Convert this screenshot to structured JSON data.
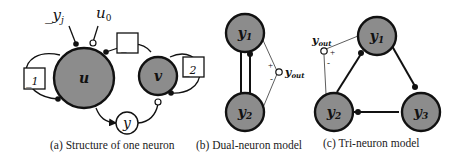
{
  "panel_a": {
    "caption": "(a) Structure of one neuron",
    "input_yj": "_y",
    "input_yj_sub": "j",
    "input_u0": "u",
    "input_u0_sub": "0",
    "node_u": "u",
    "node_v": "v",
    "node_y": "y",
    "box_top": "_",
    "box_left": "_1",
    "box_right": "_2"
  },
  "panel_b": {
    "caption": "(b) Dual-neuron model",
    "node_y1": "y",
    "node_y1_sub": "1",
    "node_y2": "y",
    "node_y2_sub": "2",
    "output": "y",
    "output_sub": "out",
    "plus": "+",
    "minus": "-"
  },
  "panel_c": {
    "caption": "(c) Tri-neuron model",
    "node_y1": "y",
    "node_y1_sub": "1",
    "node_y2": "y",
    "node_y2_sub": "2",
    "node_y3": "y",
    "node_y3_sub": "3",
    "output": "y",
    "output_sub": "out",
    "plus": "+",
    "minus": "-"
  },
  "colors": {
    "node_fill": "#8c8c8c",
    "stroke": "#111111",
    "background": "#ffffff"
  }
}
